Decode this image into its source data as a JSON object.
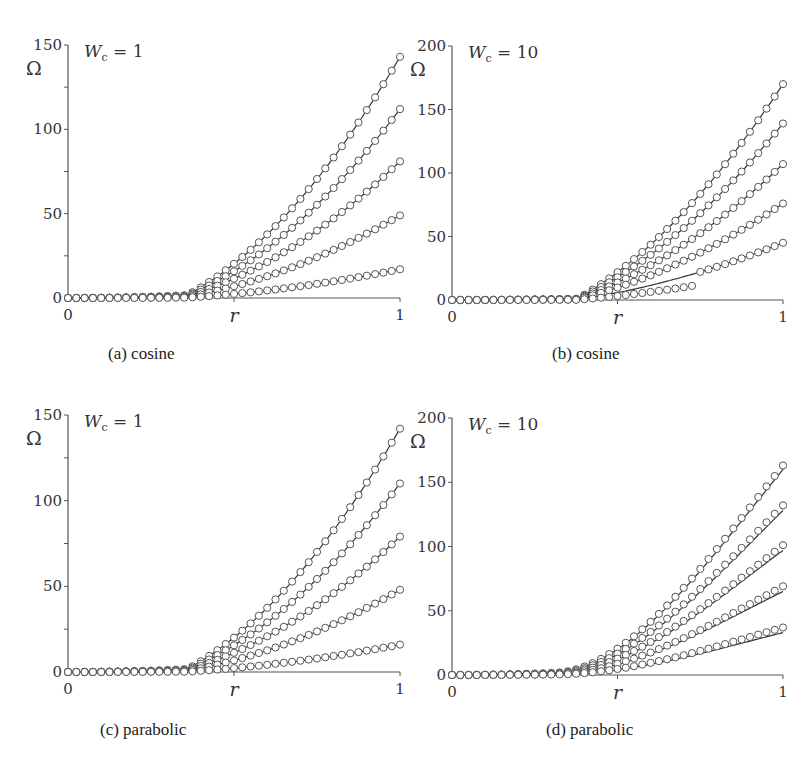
{
  "figure": {
    "panels_layout": "2x2",
    "captions": [
      "(a) cosine",
      "(b) cosine",
      "(c) parabolic",
      "(d) parabolic"
    ]
  },
  "chart_data": [
    {
      "id": "a",
      "type": "line",
      "caption": "(a) cosine",
      "annotation": "W_c = 1",
      "annotation_parts": {
        "symbol": "W",
        "subscript": "c",
        "rest": " = 1"
      },
      "xlabel": "r",
      "ylabel": "Ω",
      "xlim": [
        0,
        1
      ],
      "ylim": [
        0,
        150
      ],
      "xticks": [
        0,
        0.5,
        1
      ],
      "xtick_labels": [
        "0",
        "",
        "1"
      ],
      "yticks": [
        0,
        25,
        50,
        75,
        100,
        125,
        150
      ],
      "ytick_labels": [
        "0",
        "",
        "50",
        "",
        "100",
        "",
        "150"
      ],
      "grid": false,
      "legend": null,
      "markers": "open circles",
      "curve_form": "transition near r≈0.45 then roughly linear growth",
      "series": [
        {
          "name": "curve 1",
          "final_value": 143,
          "marker_final": 143
        },
        {
          "name": "curve 2",
          "final_value": 112,
          "marker_final": 112
        },
        {
          "name": "curve 3",
          "final_value": 81,
          "marker_final": 81
        },
        {
          "name": "curve 4",
          "final_value": 49,
          "marker_final": 49
        },
        {
          "name": "curve 5",
          "final_value": 17,
          "marker_final": 17
        }
      ],
      "geom": {
        "x0": 68,
        "x1": 400,
        "y0": 298,
        "ytop": 45
      }
    },
    {
      "id": "b",
      "type": "line",
      "caption": "(b) cosine",
      "annotation": "W_c = 10",
      "annotation_parts": {
        "symbol": "W",
        "subscript": "c",
        "rest": " = 10"
      },
      "xlabel": "r",
      "ylabel": "Ω",
      "xlim": [
        0,
        1
      ],
      "ylim": [
        0,
        200
      ],
      "xticks": [
        0,
        0.5,
        1
      ],
      "xtick_labels": [
        "0",
        "",
        "1"
      ],
      "yticks": [
        0,
        50,
        100,
        150,
        200
      ],
      "ytick_labels": [
        "0",
        "50",
        "100",
        "150",
        "200"
      ],
      "grid": false,
      "legend": null,
      "markers": "open circles; lowest series shows a jump near r≈0.75 with markers deviating below curve",
      "series": [
        {
          "name": "curve 1",
          "final_value": 170,
          "marker_final": 170
        },
        {
          "name": "curve 2",
          "final_value": 139,
          "marker_final": 139
        },
        {
          "name": "curve 3",
          "final_value": 107,
          "marker_final": 107
        },
        {
          "name": "curve 4",
          "final_value": 76,
          "marker_final": 76
        },
        {
          "name": "curve 5",
          "final_value": 45,
          "marker_final": 45
        }
      ],
      "geom": {
        "x0": 452,
        "x1": 783,
        "y0": 300,
        "ytop": 46
      }
    },
    {
      "id": "c",
      "type": "line",
      "caption": "(c) parabolic",
      "annotation": "W_c = 1",
      "annotation_parts": {
        "symbol": "W",
        "subscript": "c",
        "rest": " = 1"
      },
      "xlabel": "r",
      "ylabel": "Ω",
      "xlim": [
        0,
        1
      ],
      "ylim": [
        0,
        150
      ],
      "xticks": [
        0,
        0.5,
        1
      ],
      "xtick_labels": [
        "0",
        "",
        "1"
      ],
      "yticks": [
        0,
        25,
        50,
        75,
        100,
        125,
        150
      ],
      "ytick_labels": [
        "0",
        "",
        "50",
        "",
        "100",
        "",
        "150"
      ],
      "grid": false,
      "legend": null,
      "markers": "open circles",
      "curve_form": "transition near r≈0.45 then roughly linear growth",
      "series": [
        {
          "name": "curve 1",
          "final_value": 142,
          "marker_final": 142
        },
        {
          "name": "curve 2",
          "final_value": 110,
          "marker_final": 110
        },
        {
          "name": "curve 3",
          "final_value": 79,
          "marker_final": 79
        },
        {
          "name": "curve 4",
          "final_value": 48,
          "marker_final": 48
        },
        {
          "name": "curve 5",
          "final_value": 16,
          "marker_final": 16
        }
      ],
      "geom": {
        "x0": 68,
        "x1": 400,
        "y0": 672,
        "ytop": 415
      }
    },
    {
      "id": "d",
      "type": "line",
      "caption": "(d) parabolic",
      "annotation": "W_c = 10",
      "annotation_parts": {
        "symbol": "W",
        "subscript": "c",
        "rest": " = 10"
      },
      "xlabel": "r",
      "ylabel": "Ω",
      "xlim": [
        0,
        1
      ],
      "ylim": [
        0,
        200
      ],
      "xticks": [
        0,
        0.5,
        1
      ],
      "xtick_labels": [
        "0",
        "",
        "1"
      ],
      "yticks": [
        0,
        50,
        100,
        150,
        200
      ],
      "ytick_labels": [
        "0",
        "50",
        "100",
        "150",
        "200"
      ],
      "grid": false,
      "legend": null,
      "markers": "open circles slightly above solid curves near r=1",
      "curve_form": "smooth S-shaped growth starting near r≈0.35",
      "series": [
        {
          "name": "curve 1",
          "final_value": 160,
          "marker_final": 163
        },
        {
          "name": "curve 2",
          "final_value": 128,
          "marker_final": 132
        },
        {
          "name": "curve 3",
          "final_value": 97,
          "marker_final": 101
        },
        {
          "name": "curve 4",
          "final_value": 65,
          "marker_final": 69
        },
        {
          "name": "curve 5",
          "final_value": 33,
          "marker_final": 37
        }
      ],
      "geom": {
        "x0": 452,
        "x1": 783,
        "y0": 675,
        "ytop": 418
      }
    }
  ]
}
